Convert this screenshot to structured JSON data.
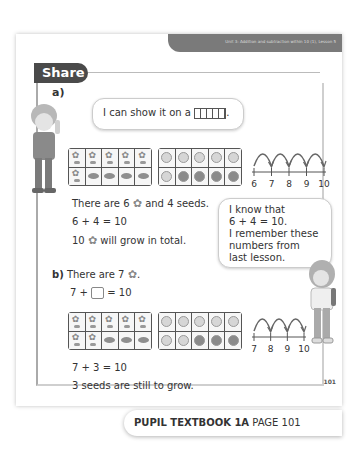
{
  "header": {
    "unit_title": "Unit 3: Addition and subtraction within 10 (1), Lesson 5"
  },
  "section": {
    "tab_label": "Share"
  },
  "part_a": {
    "label": "a)",
    "bubble_text": "I can show it on a",
    "bubble_suffix": ".",
    "ten_frame_flowers": {
      "top_row": [
        "flower",
        "flower",
        "flower",
        "flower",
        "flower"
      ],
      "bottom_row": [
        "flower",
        "seed",
        "seed",
        "seed",
        "seed"
      ]
    },
    "ten_frame_counters": {
      "top_row": [
        "light",
        "light",
        "light",
        "light",
        "light"
      ],
      "bottom_row": [
        "light",
        "dark",
        "dark",
        "dark",
        "dark"
      ]
    },
    "number_line": {
      "ticks": [
        "6",
        "7",
        "8",
        "9",
        "10"
      ],
      "jumps": 4
    },
    "line1_pre": "There are 6",
    "line1_post": "and 4 seeds.",
    "equation": "6 + 4 = 10",
    "line3_pre": "10",
    "line3_post": "will grow in total."
  },
  "bubble_right": {
    "lines": [
      "I know that",
      "6 + 4 = 10.",
      "I remember these",
      "numbers from",
      "last lesson."
    ]
  },
  "part_b": {
    "label": "b)",
    "line1_pre": "There are 7",
    "line1_post": ".",
    "equation_pre": "7 +",
    "equation_post": "= 10",
    "ten_frame_flowers": {
      "top_row": [
        "flower",
        "flower",
        "flower",
        "flower",
        "flower"
      ],
      "bottom_row": [
        "flower",
        "flower",
        "seed",
        "seed",
        "seed"
      ]
    },
    "ten_frame_counters": {
      "top_row": [
        "light",
        "light",
        "light",
        "light",
        "light"
      ],
      "bottom_row": [
        "light",
        "light",
        "dark",
        "dark",
        "dark"
      ]
    },
    "number_line": {
      "ticks": [
        "7",
        "8",
        "9",
        "10"
      ],
      "jumps": 3
    },
    "answer_equation": "7 + 3 = 10",
    "answer_text": "3 seeds are still to grow."
  },
  "page_number": "101",
  "footer": {
    "book": "PUPIL TEXTBOOK 1A",
    "page": "PAGE 101"
  }
}
